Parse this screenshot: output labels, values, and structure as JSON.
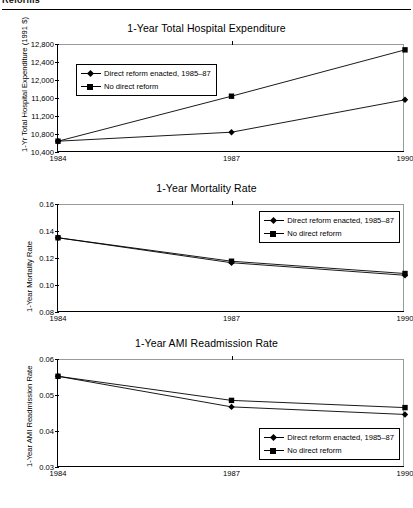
{
  "header": {
    "title": "Reforms"
  },
  "legend": {
    "series1_label": "Direct reform enacted, 1985–87",
    "series2_label": "No direct reform",
    "marker1": "diamond-marker",
    "marker2": "square-marker"
  },
  "chart_data": [
    {
      "type": "line",
      "title": "1-Year Total Hospital Expenditure",
      "xlabel": "",
      "ylabel": "1-Yr Total Hospital Expenditure (1991 $)",
      "x": [
        "1984",
        "1987",
        "1990"
      ],
      "xticklabels": [
        "1984",
        "1987",
        "1990"
      ],
      "yticklabels": [
        "10,400",
        "10,800",
        "11,200",
        "11,600",
        "12,000",
        "12,400",
        "12,800"
      ],
      "ylim": [
        10400,
        12800
      ],
      "ytick_values": [
        10400,
        10800,
        11200,
        11600,
        12000,
        12400,
        12800
      ],
      "grid": false,
      "legend_position": "upper-left-inside",
      "series": [
        {
          "name": "Direct reform enacted, 1985–87",
          "marker": "diamond",
          "values": [
            10640,
            10840,
            11560
          ]
        },
        {
          "name": "No direct reform",
          "marker": "square",
          "values": [
            10640,
            11640,
            12670
          ]
        }
      ]
    },
    {
      "type": "line",
      "title": "1-Year Mortality Rate",
      "xlabel": "",
      "ylabel": "1-Year Mortality Rate",
      "x": [
        "1984",
        "1987",
        "1990"
      ],
      "xticklabels": [
        "1984",
        "1987",
        "1990"
      ],
      "yticklabels": [
        "0.08",
        "0.10",
        "0.12",
        "0.14",
        "0.16"
      ],
      "ylim": [
        0.08,
        0.16
      ],
      "ytick_values": [
        0.08,
        0.1,
        0.12,
        0.14,
        0.16
      ],
      "grid": false,
      "legend_position": "upper-right-inside",
      "series": [
        {
          "name": "Direct reform enacted, 1985–87",
          "marker": "diamond",
          "values": [
            0.135,
            0.1165,
            0.1072
          ]
        },
        {
          "name": "No direct reform",
          "marker": "square",
          "values": [
            0.135,
            0.1176,
            0.1085
          ]
        }
      ]
    },
    {
      "type": "line",
      "title": "1-Year AMI Readmission Rate",
      "xlabel": "",
      "ylabel": "1-Year AMI Readmission Rate",
      "x": [
        "1984",
        "1987",
        "1990"
      ],
      "xticklabels": [
        "1984",
        "1987",
        "1990"
      ],
      "yticklabels": [
        "0.03",
        "0.04",
        "0.05",
        "0.06"
      ],
      "ylim": [
        0.03,
        0.06
      ],
      "ytick_values": [
        0.03,
        0.04,
        0.05,
        0.06
      ],
      "grid": false,
      "legend_position": "lower-right-inside",
      "series": [
        {
          "name": "Direct reform enacted, 1985–87",
          "marker": "diamond",
          "values": [
            0.0552,
            0.0467,
            0.0446
          ]
        },
        {
          "name": "No direct reform",
          "marker": "square",
          "values": [
            0.0552,
            0.0485,
            0.0465
          ]
        }
      ]
    }
  ]
}
